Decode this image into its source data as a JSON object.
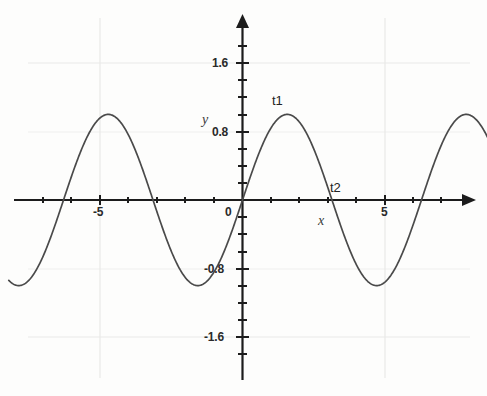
{
  "chart_data": {
    "type": "line",
    "title": "",
    "subtitle": "",
    "xlabel": "x",
    "ylabel": "y",
    "xlim": [
      -8.2,
      8.6
    ],
    "ylim": [
      -2.0,
      2.0
    ],
    "grid": true,
    "legend_position": "none",
    "function": "y = sin(x)",
    "amplitude": 1.0,
    "period": 6.28,
    "x_ticks_labeled": [
      {
        "value": -5,
        "label": "-5"
      },
      {
        "value": 0,
        "label": "0"
      },
      {
        "value": 5,
        "label": "5"
      }
    ],
    "x_ticks_minor": [
      -8,
      -7,
      -6,
      -5,
      -4,
      -3,
      -2,
      -1,
      0,
      1,
      2,
      3,
      4,
      5,
      6,
      7,
      8
    ],
    "y_ticks_labeled": [
      {
        "value": 1.6,
        "label": "1.6"
      },
      {
        "value": 0.8,
        "label": "0.8"
      },
      {
        "value": -0.8,
        "label": "-0.8"
      },
      {
        "value": -1.6,
        "label": "-1.6"
      }
    ],
    "y_ticks_minor": [
      -1.8,
      -1.6,
      -1.4,
      -1.2,
      -1.0,
      -0.8,
      -0.6,
      -0.4,
      -0.2,
      0.2,
      0.4,
      0.6,
      0.8,
      1.0,
      1.2,
      1.4,
      1.6,
      1.8
    ],
    "gridlines_x": [
      -5,
      5
    ],
    "gridlines_y": [
      1.6,
      0.8,
      -0.8,
      -1.6
    ],
    "series": [
      {
        "name": "sine",
        "color": "#4a4a4a",
        "x": [
          -8.2,
          -8.0,
          -7.5,
          -7.0,
          -6.5,
          -6.283,
          -6.0,
          -5.5,
          -5.0,
          -4.712,
          -4.5,
          -4.0,
          -3.5,
          -3.142,
          -3.0,
          -2.5,
          -2.0,
          -1.571,
          -1.5,
          -1.0,
          -0.5,
          0.0,
          0.5,
          1.0,
          1.5,
          1.571,
          2.0,
          2.5,
          3.0,
          3.142,
          3.5,
          4.0,
          4.5,
          4.712,
          5.0,
          5.5,
          6.0,
          6.283,
          6.5,
          7.0,
          7.5,
          8.0,
          8.4
        ],
        "y": [
          -0.95,
          -0.99,
          -0.94,
          -0.66,
          -0.22,
          0.0,
          0.28,
          0.71,
          0.96,
          1.0,
          0.98,
          0.76,
          0.35,
          0.0,
          -0.14,
          -0.6,
          -0.91,
          -1.0,
          -1.0,
          -0.84,
          -0.48,
          0.0,
          0.48,
          0.84,
          1.0,
          1.0,
          0.91,
          0.6,
          0.14,
          0.0,
          -0.35,
          -0.76,
          -0.98,
          -1.0,
          -0.96,
          -0.71,
          -0.28,
          0.0,
          0.22,
          0.66,
          0.94,
          0.99,
          0.87
        ]
      }
    ],
    "annotations": [
      {
        "name": "t1",
        "label": "t1",
        "x": 1.571,
        "y": 1.0,
        "description": "first maximum to the right of origin"
      },
      {
        "name": "t2",
        "label": "t2",
        "x": 3.142,
        "y": 0.0,
        "description": "zero crossing after first maximum"
      }
    ],
    "axis_labels": {
      "x_axis_letter": "x",
      "y_axis_letter": "y"
    }
  },
  "axes": {
    "x_name": "x",
    "y_name": "y"
  },
  "ticks": {
    "x": {
      "neg_five": "-5",
      "zero": "0",
      "five": "5"
    },
    "y": {
      "pos_one_six": "1.6",
      "pos_zero_eight": "0.8",
      "neg_zero_eight": "-0.8",
      "neg_one_six": "-1.6"
    }
  },
  "markers": {
    "t1": "t1",
    "t2": "t2"
  },
  "colors": {
    "curve": "#4a4a4a",
    "axis": "#1c1c1c",
    "grid": "#e8e8e6",
    "text": "#2a2a2a",
    "background": "#fdfdfc"
  }
}
